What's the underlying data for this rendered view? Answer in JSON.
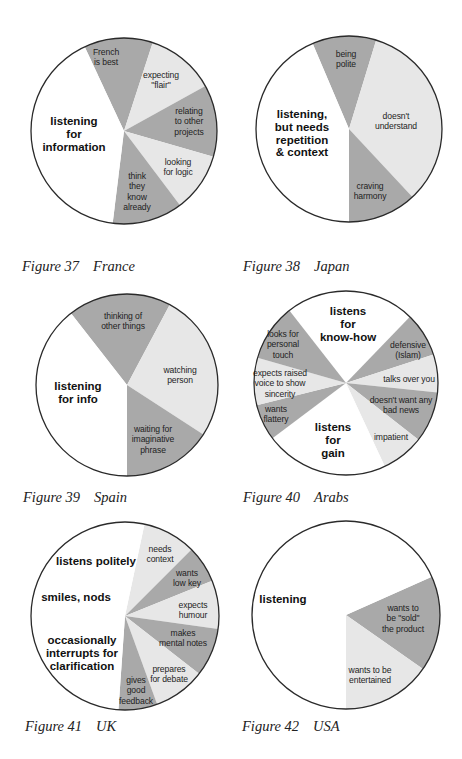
{
  "colors": {
    "white": "#ffffff",
    "light": "#e7e7e7",
    "dark": "#a9a9a9",
    "outline": "#2a2a2a"
  },
  "chart_data": [
    {
      "type": "pie",
      "title": "Figure 37 France",
      "figure": "Figure 37",
      "country": "France",
      "center": [
        124,
        131
      ],
      "radius": 93,
      "caption_pos": [
        22,
        268
      ],
      "slices": [
        {
          "label": "French\nis best",
          "start": 335,
          "end": 18,
          "shade": "dark",
          "lx": 106,
          "ly": 57,
          "big": false
        },
        {
          "label": "expecting\n\"flair\"",
          "start": 18,
          "end": 61,
          "shade": "light",
          "lx": 161,
          "ly": 80,
          "big": false
        },
        {
          "label": "relating\nto other\nprojects",
          "start": 61,
          "end": 106,
          "shade": "dark",
          "lx": 189,
          "ly": 122,
          "big": false
        },
        {
          "label": "looking\nfor logic",
          "start": 106,
          "end": 143,
          "shade": "light",
          "lx": 178,
          "ly": 167,
          "big": false
        },
        {
          "label": "think\nthey\nknow\nalready",
          "start": 143,
          "end": 187,
          "shade": "dark",
          "lx": 137,
          "ly": 192,
          "big": false
        },
        {
          "label": "listening\nfor\ninformation",
          "start": 187,
          "end": 335,
          "shade": "white",
          "lx": 74,
          "ly": 134,
          "big": true
        }
      ]
    },
    {
      "type": "pie",
      "title": "Figure 38 Japan",
      "figure": "Figure 38",
      "country": "Japan",
      "center": [
        349,
        129
      ],
      "radius": 93,
      "caption_pos": [
        243,
        268
      ],
      "slices": [
        {
          "label": "being\npolite",
          "start": 337,
          "end": 17,
          "shade": "dark",
          "lx": 346,
          "ly": 59,
          "big": false
        },
        {
          "label": "doesn't\nunderstand",
          "start": 17,
          "end": 137,
          "shade": "light",
          "lx": 396,
          "ly": 121,
          "big": false
        },
        {
          "label": "craving\nharmony",
          "start": 137,
          "end": 180,
          "shade": "dark",
          "lx": 370,
          "ly": 191,
          "big": false
        },
        {
          "label": "listening,\nbut needs\nrepetition\n& context",
          "start": 180,
          "end": 337,
          "shade": "white",
          "lx": 302,
          "ly": 134,
          "big": true
        }
      ]
    },
    {
      "type": "pie",
      "title": "Figure 39 Spain",
      "figure": "Figure 39",
      "country": "Spain",
      "center": [
        127,
        385
      ],
      "radius": 91,
      "caption_pos": [
        23,
        499
      ],
      "slices": [
        {
          "label": "thinking of\nother things",
          "start": 322,
          "end": 28,
          "shade": "dark",
          "lx": 123,
          "ly": 321,
          "big": false
        },
        {
          "label": "watching\nperson",
          "start": 28,
          "end": 123,
          "shade": "light",
          "lx": 180,
          "ly": 375,
          "big": false
        },
        {
          "label": "waiting for\nimaginative\nphrase",
          "start": 123,
          "end": 180,
          "shade": "dark",
          "lx": 153,
          "ly": 440,
          "big": false
        },
        {
          "label": "listening\nfor info",
          "start": 180,
          "end": 322,
          "shade": "white",
          "lx": 78,
          "ly": 393,
          "big": true
        }
      ]
    },
    {
      "type": "pie",
      "title": "Figure 40 Arabs",
      "figure": "Figure 40",
      "country": "Arabs",
      "center": [
        346,
        383
      ],
      "radius": 92,
      "caption_pos": [
        243,
        499
      ],
      "slices": [
        {
          "label": "listens\nfor\nknow-how",
          "start": 322,
          "end": 44,
          "shade": "white",
          "lx": 348,
          "ly": 324,
          "big": true
        },
        {
          "label": "defensive\n(Islam)",
          "start": 44,
          "end": 72,
          "shade": "dark",
          "lx": 408,
          "ly": 350,
          "big": false
        },
        {
          "label": "talks over you",
          "start": 72,
          "end": 96,
          "shade": "light",
          "lx": 409,
          "ly": 379,
          "big": false
        },
        {
          "label": "doesn't want any\nbad news",
          "start": 96,
          "end": 128,
          "shade": "dark",
          "lx": 401,
          "ly": 405,
          "big": false
        },
        {
          "label": "impatient",
          "start": 128,
          "end": 155,
          "shade": "light",
          "lx": 391,
          "ly": 437,
          "big": false
        },
        {
          "label": "listens\nfor\ngain",
          "start": 155,
          "end": 233,
          "shade": "white",
          "lx": 333,
          "ly": 440,
          "big": true
        },
        {
          "label": "wants\nflattery",
          "start": 233,
          "end": 256,
          "shade": "dark",
          "lx": 276,
          "ly": 414,
          "big": false
        },
        {
          "label": "expects raised\nvoice to show\nsincerity",
          "start": 256,
          "end": 286,
          "shade": "light",
          "lx": 280,
          "ly": 384,
          "big": false
        },
        {
          "label": "looks for\npersonal\ntouch",
          "start": 286,
          "end": 322,
          "shade": "dark",
          "lx": 283,
          "ly": 345,
          "big": false
        }
      ]
    },
    {
      "type": "pie",
      "title": "Figure 41 UK",
      "figure": "Figure 41",
      "country": "UK",
      "center": [
        125,
        616
      ],
      "radius": 94,
      "caption_pos": [
        25,
        728
      ],
      "slices": [
        {
          "label": "needs\ncontext",
          "start": 12,
          "end": 45,
          "shade": "light",
          "lx": 160,
          "ly": 554,
          "big": false
        },
        {
          "label": "wants\nlow key",
          "start": 45,
          "end": 68,
          "shade": "dark",
          "lx": 187,
          "ly": 578,
          "big": false
        },
        {
          "label": "expects\nhumour",
          "start": 68,
          "end": 98,
          "shade": "light",
          "lx": 193,
          "ly": 610,
          "big": false
        },
        {
          "label": "makes\nmental notes",
          "start": 98,
          "end": 128,
          "shade": "dark",
          "lx": 183,
          "ly": 638,
          "big": false
        },
        {
          "label": "prepares\nfor debate",
          "start": 128,
          "end": 160,
          "shade": "light",
          "lx": 169,
          "ly": 674,
          "big": false
        },
        {
          "label": "gives\ngood\nfeedback",
          "start": 160,
          "end": 184,
          "shade": "dark",
          "lx": 136,
          "ly": 691,
          "big": false
        },
        {
          "label": "listens politely",
          "start": 184,
          "end": 372,
          "shade": "white",
          "lx": 96,
          "ly": 561,
          "big": true,
          "extra": [
            {
              "label": "smiles, nods",
              "lx": 76,
              "ly": 597
            },
            {
              "label": "occasionally\ninterrupts for\nclarification",
              "lx": 82,
              "ly": 653
            }
          ]
        }
      ]
    },
    {
      "type": "pie",
      "title": "Figure 42 USA",
      "figure": "Figure 42",
      "country": "USA",
      "center": [
        346,
        615
      ],
      "radius": 94,
      "caption_pos": [
        242,
        728
      ],
      "slices": [
        {
          "label": "wants to\nbe \"sold\"\nthe product",
          "start": 66,
          "end": 125,
          "shade": "dark",
          "lx": 403,
          "ly": 619,
          "big": false
        },
        {
          "label": "wants to be\nentertained",
          "start": 125,
          "end": 180,
          "shade": "light",
          "lx": 370,
          "ly": 675,
          "big": false
        },
        {
          "label": "listening",
          "start": 180,
          "end": 426,
          "shade": "white",
          "lx": 283,
          "ly": 599,
          "big": true
        }
      ]
    }
  ]
}
